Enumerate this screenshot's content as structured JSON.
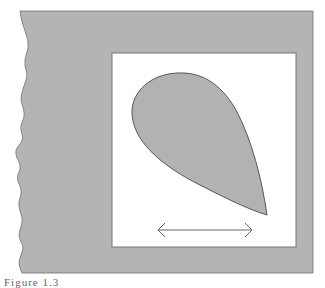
{
  "figure": {
    "background_color": "#b4b4b4",
    "panel_color": "#ffffff",
    "shape_fill": "#b2b2b2",
    "stroke_color": "#555555",
    "arrow_color": "#666666",
    "shape": "teardrop",
    "arrow": "double-headed-horizontal-arrow"
  },
  "caption": {
    "text": "Figure 1.3"
  }
}
